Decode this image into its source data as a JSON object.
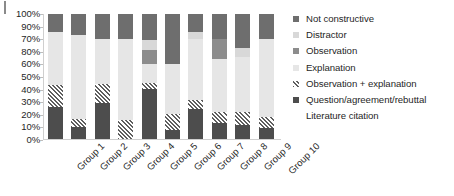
{
  "chart_data": {
    "type": "bar",
    "subtype": "stacked-bar-100-percent",
    "title": "",
    "xlabel": "",
    "ylabel": "",
    "ylim": [
      0,
      100
    ],
    "grid": false,
    "legend_position": "right",
    "ytick_labels": [
      "100%",
      "90%",
      "70%",
      "80%",
      "60%",
      "50%",
      "40%",
      "30%",
      "20%",
      "10%",
      "0%"
    ],
    "ytick_values": [
      100,
      90,
      80,
      70,
      60,
      50,
      40,
      30,
      20,
      10,
      0
    ],
    "categories": [
      "Group 1",
      "Group 2",
      "Group 3",
      "Group 4",
      "Group 5",
      "Group 6",
      "Group 7",
      "Group 8",
      "Group 9",
      "Group 10"
    ],
    "series": [
      {
        "name": "Question/agreement/rebuttal",
        "color": "#4d4d4d",
        "values": [
          26,
          10,
          29,
          0,
          40,
          7,
          24,
          13,
          11,
          9
        ]
      },
      {
        "name": "Observation + explanation",
        "color": "#5f5f5f",
        "pattern": "diagonal-hatch",
        "values": [
          17,
          6,
          15,
          15,
          5,
          13,
          7,
          9,
          11,
          9
        ]
      },
      {
        "name": "Explanation",
        "color": "#e6e6e6",
        "values": [
          43,
          67,
          36,
          65,
          15,
          40,
          49,
          42,
          44,
          62
        ]
      },
      {
        "name": "Observation",
        "color": "#8c8c8c",
        "values": [
          0,
          0,
          0,
          0,
          11,
          0,
          0,
          16,
          0,
          0
        ]
      },
      {
        "name": "Distractor",
        "color": "#d8d8d8",
        "values": [
          0,
          0,
          0,
          0,
          8,
          0,
          6,
          0,
          7,
          0
        ]
      },
      {
        "name": "Not constructive",
        "color": "#6e6e6e",
        "values": [
          14,
          17,
          20,
          20,
          21,
          40,
          14,
          20,
          27,
          20
        ]
      }
    ]
  },
  "legend": {
    "items": [
      {
        "label": "Not constructive",
        "swatch": "legend-swatch-not-constructive",
        "color": "#6e6e6e"
      },
      {
        "label": "Distractor",
        "swatch": "legend-swatch-distractor",
        "color": "#d8d8d8"
      },
      {
        "label": "Observation",
        "swatch": "legend-swatch-observation",
        "color": "#8c8c8c"
      },
      {
        "label": "Explanation",
        "swatch": "legend-swatch-explanation",
        "color": "#e6e6e6"
      },
      {
        "label": "Observation + explanation",
        "swatch": "legend-swatch-observation-explanation",
        "color": "#5f5f5f"
      },
      {
        "label": "Question/agreement/rebuttal",
        "swatch": "legend-swatch-question",
        "color": "#4d4d4d"
      },
      {
        "label": "Literature citation",
        "swatch": "legend-swatch-literature",
        "color": "#bfbfbf"
      }
    ]
  }
}
